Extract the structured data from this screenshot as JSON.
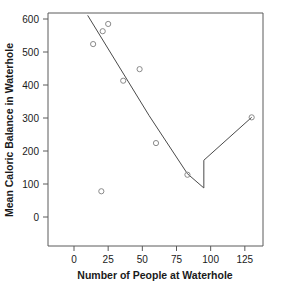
{
  "chart_data": {
    "type": "scatter",
    "title": "",
    "xlabel": "Number of People at Waterhole",
    "ylabel": "Mean Caloric Balance in Waterhole",
    "xlim": [
      0,
      140
    ],
    "ylim": [
      0,
      630
    ],
    "xticks": [
      0,
      25,
      50,
      75,
      100,
      125
    ],
    "xtick_labels": [
      "0",
      "25",
      "50",
      "75",
      "100",
      "125"
    ],
    "yticks": [
      0,
      100,
      200,
      300,
      400,
      500,
      600
    ],
    "ytick_labels": [
      "0",
      "100",
      "200",
      "300",
      "400",
      "500",
      "600"
    ],
    "grid": false,
    "legend": false,
    "marker": "open-circle",
    "points": [
      {
        "x": 14,
        "y": 524
      },
      {
        "x": 20,
        "y": 78
      },
      {
        "x": 21,
        "y": 563
      },
      {
        "x": 25,
        "y": 585
      },
      {
        "x": 36,
        "y": 413
      },
      {
        "x": 48,
        "y": 448
      },
      {
        "x": 60,
        "y": 224
      },
      {
        "x": 83,
        "y": 128
      },
      {
        "x": 130,
        "y": 302
      }
    ],
    "series": [
      {
        "name": "fitted-segmented-line",
        "type": "line",
        "note": "piecewise linear fit with vertical discontinuity at x=95",
        "vertices": [
          {
            "x": 10,
            "y": 611
          },
          {
            "x": 55,
            "y": 307
          },
          {
            "x": 83,
            "y": 131
          },
          {
            "x": 95,
            "y": 88
          },
          {
            "x": 95,
            "y": 172
          },
          {
            "x": 130,
            "y": 302
          }
        ]
      }
    ]
  },
  "axes": {
    "x_title": "Number of People at Waterhole",
    "y_title": "Mean Caloric Balance in Waterhole"
  }
}
